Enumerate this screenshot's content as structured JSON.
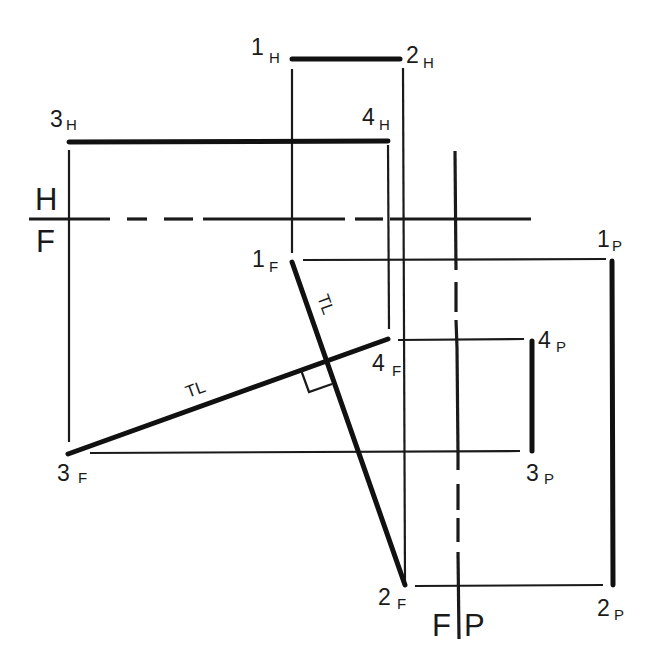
{
  "diagram": {
    "type": "descriptive-geometry-auxiliary-views",
    "fold_lines": {
      "hf": {
        "top_label": "H",
        "bottom_label": "F"
      },
      "fp": {
        "left_label": "F",
        "right_label": "P"
      }
    },
    "points": {
      "p1h": {
        "num": "1",
        "view": "H"
      },
      "p2h": {
        "num": "2",
        "view": "H"
      },
      "p3h": {
        "num": "3",
        "view": "H"
      },
      "p4h": {
        "num": "4",
        "view": "H"
      },
      "p1f": {
        "num": "1",
        "view": "F"
      },
      "p2f": {
        "num": "2",
        "view": "F"
      },
      "p3f": {
        "num": "3",
        "view": "F"
      },
      "p4f": {
        "num": "4",
        "view": "F"
      },
      "p1p": {
        "num": "1",
        "view": "P"
      },
      "p2p": {
        "num": "2",
        "view": "P"
      },
      "p3p": {
        "num": "3",
        "view": "P"
      },
      "p4p": {
        "num": "4",
        "view": "P"
      }
    },
    "annotations": {
      "tl_line_12": "TL",
      "tl_line_34": "TL",
      "right_angle_marker": "perpendicular"
    },
    "colors": {
      "ink": "#1a1a1a",
      "background": "#ffffff"
    }
  }
}
